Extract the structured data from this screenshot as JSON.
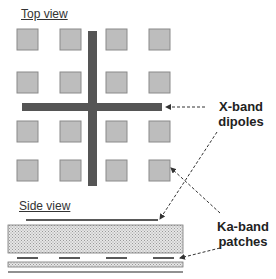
{
  "titles": {
    "top_view": "Top view",
    "side_view": "Side view"
  },
  "labels": {
    "x_band_line1": "X-band",
    "x_band_line2": "dipoles",
    "ka_band_line1": "Ka-band",
    "ka_band_line2": "patches"
  },
  "colors": {
    "patch_fill": "#bdbdbd",
    "patch_stroke": "#8a8a8a",
    "dipole": "#555555",
    "substrate": "#d9d9d9",
    "line": "#222222"
  },
  "top_view": {
    "patch_grid": {
      "rows": 4,
      "cols": 4
    },
    "dipoles": [
      "vertical",
      "horizontal"
    ]
  },
  "side_view": {
    "layers": [
      "X-band dipole",
      "thick substrate",
      "Ka-band patches",
      "thin substrate",
      "ground plane"
    ],
    "ka_patch_count": 4
  }
}
